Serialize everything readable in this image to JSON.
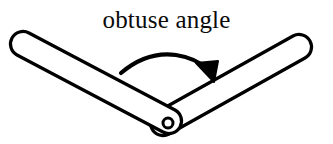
{
  "figure": {
    "kind": "geometry-diagram",
    "background_color": "#ffffff",
    "ink_color": "#000000",
    "label": {
      "text": "obtuse angle",
      "color": "#0b0b0b",
      "align": "center",
      "font_style": "serif",
      "font_size_px": 25
    },
    "annotation_arrow": {
      "name": "angle-sweep-arrow",
      "shape": "curved-arc",
      "direction": "left-to-right",
      "head": "filled-triangle",
      "head_points_to": "right-arm",
      "stroke_color": "#000000",
      "fill_color": "#000000",
      "start_point": [
        121,
        73
      ],
      "apex_point": [
        170,
        55
      ],
      "end_point": [
        212,
        78
      ]
    },
    "arms": [
      {
        "name": "left-arm",
        "from": [
          22,
          44
        ],
        "to": [
          170,
          122
        ],
        "thickness_px": 25,
        "end_cap": "round",
        "fill_color": "#ffffff",
        "stroke_color": "#000000"
      },
      {
        "name": "right-arm",
        "from": [
          170,
          122
        ],
        "to": [
          313,
          49
        ],
        "thickness_px": 25,
        "end_cap": "round",
        "fill_color": "#ffffff",
        "stroke_color": "#000000"
      }
    ],
    "pivot": {
      "name": "hinge-pivot",
      "shape": "circle",
      "center": [
        168,
        123
      ],
      "radius_px": 5,
      "fill_color": "#ffffff",
      "stroke_color": "#000000"
    }
  }
}
